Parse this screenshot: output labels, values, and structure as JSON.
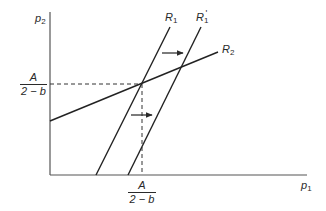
{
  "axes": {
    "y_label": {
      "base": "p",
      "sub": "2"
    },
    "x_label": {
      "base": "p",
      "sub": "1"
    }
  },
  "curves": {
    "r1": {
      "base": "R",
      "sub": "1"
    },
    "r1_shifted": {
      "base": "R",
      "sub": "1",
      "prime": "'"
    },
    "r2": {
      "base": "R",
      "sub": "2"
    }
  },
  "equilibrium": {
    "y_value": {
      "numerator": "A",
      "denominator": "2 − b"
    },
    "x_value": {
      "numerator": "A",
      "denominator": "2 − b"
    }
  },
  "arrows": [
    {
      "name": "upper-shift-arrow",
      "direction": "right"
    },
    {
      "name": "lower-shift-arrow",
      "direction": "right"
    }
  ],
  "colors": {
    "ink": "#2a2a2a",
    "background": "#ffffff"
  }
}
